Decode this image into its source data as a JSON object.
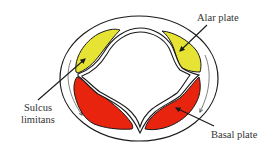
{
  "diagram": {
    "labels": {
      "alar_plate": "Alar plate",
      "sulcus_line1": "Sulcus",
      "sulcus_line2": "limitans",
      "basal_plate": "Basal plate"
    },
    "colors": {
      "alar_fill": "#e6e335",
      "basal_fill": "#e8240f",
      "outline": "#1a1a1a",
      "background": "#ffffff",
      "label_text": "#333333"
    },
    "regions": [
      {
        "name": "alar-plate-left",
        "fill": "alar"
      },
      {
        "name": "alar-plate-right",
        "fill": "alar"
      },
      {
        "name": "basal-plate-left",
        "fill": "basal"
      },
      {
        "name": "basal-plate-right",
        "fill": "basal"
      }
    ]
  }
}
